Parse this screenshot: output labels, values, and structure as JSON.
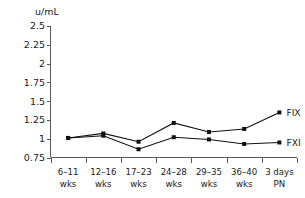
{
  "chart_data": {
    "type": "line",
    "title": "",
    "xlabel": "",
    "ylabel": "u/mL",
    "ylim": [
      0.75,
      2.5
    ],
    "yticks": [
      "0.75",
      "1",
      "1.25",
      "1.5",
      "1.75",
      "2",
      "2.25",
      "2.5"
    ],
    "ytick_values": [
      0.75,
      1,
      1.25,
      1.5,
      1.75,
      2,
      2.25,
      2.5
    ],
    "grid": false,
    "legend_position": "right-inline",
    "categories": [
      "6–11 wks",
      "12–16 wks",
      "17–23 wks",
      "24–28 wks",
      "29–35 wks",
      "36–40 wks",
      "3 days PN"
    ],
    "category_lines": [
      [
        "6–11",
        "wks"
      ],
      [
        "12–16",
        "wks"
      ],
      [
        "17–23",
        "wks"
      ],
      [
        "24–28",
        "wks"
      ],
      [
        "29–35",
        "wks"
      ],
      [
        "36–40",
        "wks"
      ],
      [
        "3 days",
        "PN"
      ]
    ],
    "series": [
      {
        "name": "FIX",
        "values": [
          1.01,
          1.07,
          0.96,
          1.21,
          1.09,
          1.13,
          1.35
        ]
      },
      {
        "name": "FXI",
        "values": [
          1.01,
          1.04,
          0.86,
          1.02,
          0.99,
          0.93,
          0.95
        ]
      }
    ]
  },
  "colors": {
    "line": "#111111",
    "axis": "#5a5a5a",
    "text": "#1a1a1a",
    "background": "#ffffff"
  }
}
